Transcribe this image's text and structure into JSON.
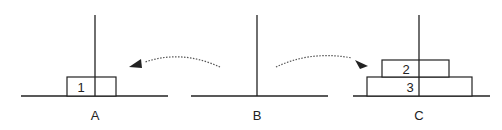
{
  "diagram": {
    "pegs": [
      {
        "label": "A",
        "x": 95
      },
      {
        "label": "B",
        "x": 257
      },
      {
        "label": "C",
        "x": 419
      }
    ],
    "disks": [
      {
        "label": "1",
        "peg": "A"
      },
      {
        "label": "2",
        "peg": "C"
      },
      {
        "label": "3",
        "peg": "C"
      }
    ],
    "arrows": [
      {
        "from": "B",
        "to": "A",
        "style": "dotted"
      },
      {
        "from": "B",
        "to": "C",
        "style": "dotted"
      }
    ],
    "colors": {
      "line": "#222222",
      "arrow": "#555555",
      "background": "#ffffff"
    }
  }
}
